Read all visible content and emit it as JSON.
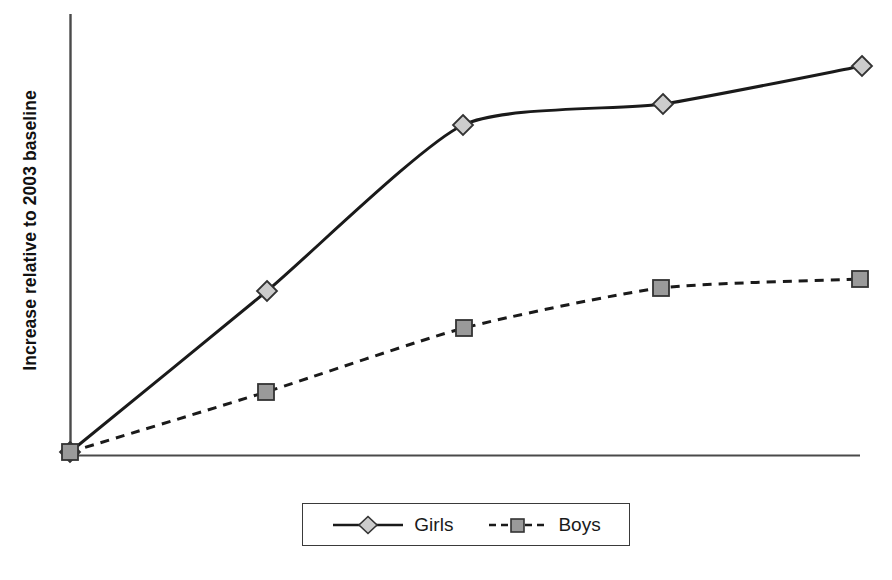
{
  "chart_data": {
    "type": "line",
    "title": "",
    "subtitle": "",
    "xlabel": "",
    "ylabel": "Increase relative to 2003 baseline",
    "xlim": [
      0,
      4
    ],
    "ylim": [
      0,
      100
    ],
    "grid": false,
    "x_tick_labels": [],
    "y_tick_labels": [],
    "legend_position": "bottom",
    "categories": [
      "0",
      "1",
      "2",
      "3",
      "4"
    ],
    "series": [
      {
        "name": "Girls",
        "marker": "diamond",
        "line_style": "solid",
        "line_color": "#1a1a1a",
        "marker_fill": "#cccccc",
        "marker_edge": "#333333",
        "values": [
          0,
          36.5,
          74.5,
          79,
          87.5
        ],
        "pixel_points": [
          {
            "x": 70,
            "y": 452
          },
          {
            "x": 267,
            "y": 291
          },
          {
            "x": 463,
            "y": 125
          },
          {
            "x": 663,
            "y": 104
          },
          {
            "x": 862,
            "y": 66
          }
        ]
      },
      {
        "name": "Boys",
        "marker": "square",
        "line_style": "dashed",
        "line_color": "#1a1a1a",
        "marker_fill": "#9a9a9a",
        "marker_edge": "#333333",
        "values": [
          0,
          13.6,
          28.2,
          37.3,
          39.3
        ],
        "pixel_points": [
          {
            "x": 70,
            "y": 452
          },
          {
            "x": 266,
            "y": 392
          },
          {
            "x": 464,
            "y": 328
          },
          {
            "x": 661,
            "y": 288
          },
          {
            "x": 860,
            "y": 279
          }
        ]
      }
    ]
  },
  "axes": {
    "y_axis_label": "Increase relative to 2003 baseline",
    "axis_color": "#4a4a4a",
    "origin": {
      "x": 70,
      "y": 455
    },
    "y_axis_top": 14,
    "x_axis_right": 860
  },
  "legend": {
    "entries": [
      {
        "label": "Girls",
        "marker": "diamond",
        "line_style": "solid"
      },
      {
        "label": "Boys",
        "marker": "square",
        "line_style": "dashed"
      }
    ]
  },
  "colors": {
    "background": "#ffffff",
    "line": "#1a1a1a",
    "axis": "#4a4a4a",
    "girls_marker_fill": "#cccccc",
    "boys_marker_fill": "#9a9a9a",
    "marker_edge": "#333333",
    "legend_border": "#3a3a3a"
  }
}
